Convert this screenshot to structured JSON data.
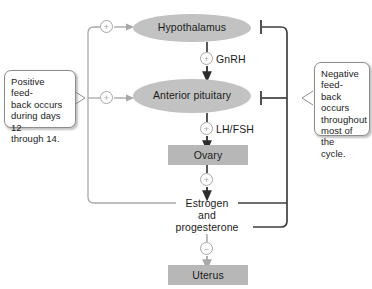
{
  "diagram": {
    "nodes": {
      "hypothalamus": "Hypothalamus",
      "anterior_pituitary": "Anterior\npituitary",
      "ovary": "Ovary",
      "uterus": "Uterus",
      "estrogen_line1": "Estrogen",
      "estrogen_line2": "and",
      "estrogen_line3": "progesterone"
    },
    "hormones": {
      "gnrh": "GnRH",
      "lhfsh": "LH/FSH"
    },
    "signs": {
      "positive": "+",
      "negative": "−"
    },
    "callouts": {
      "positive": "Positive feed-\nback occurs\nduring days 12\nthrough 14.",
      "negative": "Negative feed-\nback occurs\nthroughout\nmost of the\ncycle."
    },
    "colors": {
      "ellipse_fill": "#c2c2c2",
      "box_fill": "#b7b7b7",
      "dark_line": "#3f3f3f",
      "grey_line": "#a8a8a8",
      "text": "#1b1b1b",
      "callout_border": "#8d8d8d",
      "background": "#ffffff"
    }
  }
}
